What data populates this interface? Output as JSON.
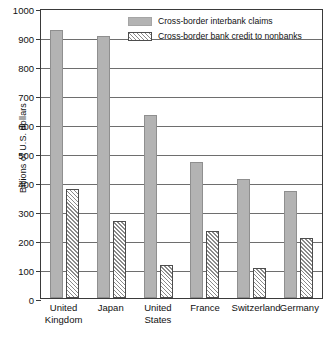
{
  "chart_data": {
    "type": "bar",
    "title": "",
    "xlabel": "",
    "ylabel": "Billions of U.S. dollars",
    "ylim": [
      0,
      1000
    ],
    "ytick_labels": [
      "1000",
      "900",
      "800",
      "700",
      "600",
      "500",
      "400",
      "300",
      "200",
      "100",
      "0"
    ],
    "yticks": [
      1000,
      900,
      800,
      700,
      600,
      500,
      400,
      300,
      200,
      100,
      0
    ],
    "grid": true,
    "legend_position": "top-right-inside",
    "categories": [
      "United Kingdom",
      "Japan",
      "United States",
      "France",
      "Switzerland",
      "Germany"
    ],
    "category_lines": [
      [
        "United",
        "Kingdom"
      ],
      [
        "Japan"
      ],
      [
        "United",
        "States"
      ],
      [
        "France"
      ],
      [
        "Switzerland"
      ],
      [
        "Germany"
      ]
    ],
    "series": [
      {
        "name": "Cross-border interbank claims",
        "style": "solid-gray",
        "color": "#b3b3b3",
        "values": [
          925,
          905,
          630,
          470,
          412,
          370
        ]
      },
      {
        "name": "Cross-border bank credit to nonbanks",
        "style": "diagonal-hatch",
        "color": "#8a8a8a",
        "values": [
          377,
          264,
          113,
          230,
          102,
          206
        ]
      }
    ]
  },
  "legend": {
    "items": [
      {
        "label": "Cross-border interbank claims",
        "swatch": "solid"
      },
      {
        "label": "Cross-border bank credit to nonbanks",
        "swatch": "hatch"
      }
    ]
  }
}
